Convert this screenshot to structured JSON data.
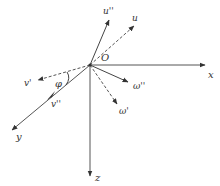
{
  "diagram": {
    "type": "vector-coordinate-frame",
    "origin": {
      "label": "O",
      "x": 90,
      "y": 65
    },
    "axes": [
      {
        "id": "x",
        "label": "x",
        "end": [
          205,
          65
        ],
        "label_pos": [
          210,
          77
        ]
      },
      {
        "id": "y",
        "label": "y",
        "end": [
          12,
          130
        ],
        "label_pos": [
          16,
          140
        ]
      },
      {
        "id": "z",
        "label": "z",
        "end": [
          90,
          176
        ],
        "label_pos": [
          97,
          180
        ]
      }
    ],
    "vectors": [
      {
        "id": "u-double-prime",
        "label": "u''",
        "style": "solid",
        "end": [
          109,
          20
        ],
        "label_pos": [
          104,
          13
        ]
      },
      {
        "id": "u",
        "label": "u",
        "style": "dashed",
        "end": [
          134,
          26
        ],
        "label_pos": [
          133,
          20
        ]
      },
      {
        "id": "v-prime",
        "label": "v'",
        "style": "dashed",
        "end": [
          38,
          80
        ],
        "label_pos": [
          25,
          86
        ]
      },
      {
        "id": "v-double-prime",
        "label": "v''",
        "style": "solid-midarrow",
        "arrow_at": [
          50,
          98
        ],
        "label_pos": [
          52,
          106
        ]
      },
      {
        "id": "omega-double-prime",
        "label": "ω''",
        "style": "solid",
        "end": [
          128,
          82
        ],
        "label_pos": [
          134,
          88
        ]
      },
      {
        "id": "omega-prime",
        "label": "ω'",
        "style": "dashed",
        "end": [
          117,
          104
        ],
        "label_pos": [
          120,
          113
        ]
      }
    ],
    "angles": [
      {
        "id": "phi",
        "label": "φ",
        "between": [
          "v-prime",
          "y"
        ],
        "label_pos": [
          57,
          85
        ]
      }
    ],
    "colors": {
      "line": "#444444",
      "text": "#333333",
      "background": "#ffffff"
    }
  }
}
